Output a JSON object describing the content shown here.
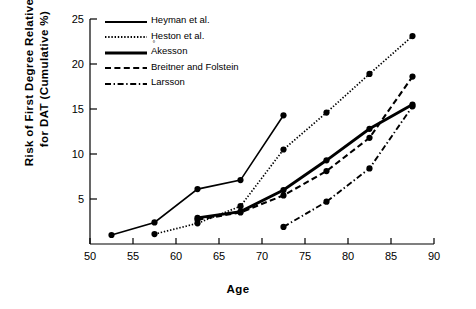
{
  "axes": {
    "x_label": "Age",
    "y_label_line1": "Risk of First Degree Relatives",
    "y_label_line2": "for DAT (Cumulative %)",
    "x_ticks": [
      "50",
      "55",
      "60",
      "65",
      "70",
      "75",
      "80",
      "85",
      "90"
    ],
    "y_ticks": [
      "5",
      "10",
      "15",
      "20",
      "25"
    ]
  },
  "legend": {
    "items": [
      {
        "label": "Heyman et al.",
        "style": "solid-thin",
        "superscript": ""
      },
      {
        "label": "Heston et al.",
        "style": "dotted",
        "superscript": ""
      },
      {
        "label": "Akesson",
        "style": "solid-thick",
        "superscript": "°"
      },
      {
        "label": "Breitner and Folstein",
        "style": "dashed",
        "superscript": ""
      },
      {
        "label": "Larsson",
        "style": "dash-dot",
        "superscript": ""
      }
    ]
  },
  "chart_data": {
    "type": "line",
    "title": "",
    "xlabel": "Age",
    "ylabel": "Risk of First Degree Relatives for DAT (Cumulative %)",
    "xlim": [
      50,
      90
    ],
    "ylim": [
      0,
      25
    ],
    "xticks": [
      50,
      55,
      60,
      65,
      70,
      75,
      80,
      85,
      90
    ],
    "yticks": [
      5,
      10,
      15,
      20,
      25
    ],
    "grid": false,
    "legend_position": "top-left-inside",
    "markers": "filled-circle",
    "series": [
      {
        "name": "Heyman et al.",
        "style": "solid-thin",
        "x": [
          52.5,
          57.5,
          62.5,
          67.5,
          72.5
        ],
        "y": [
          1.0,
          2.4,
          6.1,
          7.1,
          14.3
        ]
      },
      {
        "name": "Heston et al.",
        "style": "dotted",
        "x": [
          57.5,
          62.5,
          67.5,
          72.5,
          77.5,
          82.5,
          87.5
        ],
        "y": [
          1.1,
          2.3,
          4.2,
          10.5,
          14.6,
          18.9,
          23.1
        ]
      },
      {
        "name": "Akesson",
        "style": "solid-thick",
        "x": [
          62.5,
          67.5,
          72.5,
          77.5,
          82.5,
          87.5
        ],
        "y": [
          2.9,
          3.6,
          6.0,
          9.3,
          12.8,
          15.5
        ]
      },
      {
        "name": "Breitner and Folstein",
        "style": "dashed",
        "x": [
          62.5,
          67.5,
          72.5,
          77.5,
          82.5,
          87.5
        ],
        "y": [
          2.7,
          3.5,
          5.4,
          8.1,
          11.8,
          18.6
        ]
      },
      {
        "name": "Larsson",
        "style": "dash-dot",
        "x": [
          72.5,
          77.5,
          82.5,
          87.5
        ],
        "y": [
          1.9,
          4.7,
          8.4,
          15.3
        ]
      }
    ]
  }
}
